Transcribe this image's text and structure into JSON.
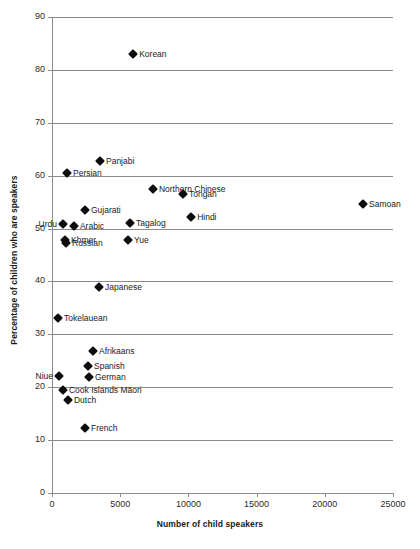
{
  "chart_data": {
    "type": "scatter",
    "title": "",
    "xlabel": "Number of child speakers",
    "ylabel": "Percentage of children who are speakers",
    "xlim": [
      0,
      25000
    ],
    "ylim": [
      0,
      90
    ],
    "xticks": [
      0,
      5000,
      10000,
      15000,
      20000,
      25000
    ],
    "yticks": [
      0,
      10,
      20,
      30,
      40,
      50,
      60,
      70,
      80,
      90
    ],
    "xtick_labels": [
      "0",
      "5000",
      "10000",
      "15000",
      "20000",
      "25000"
    ],
    "ytick_labels": [
      "0",
      "10",
      "20",
      "30",
      "40",
      "50",
      "60",
      "70",
      "80",
      "90"
    ],
    "grid": "horizontal",
    "legend": "none",
    "marker": "diamond",
    "marker_color": "#0d0d0d",
    "grid_color": "#8c8c8c",
    "points": [
      {
        "label": "Korean",
        "x": 5950,
        "y": 83.0,
        "label_side": "right"
      },
      {
        "label": "Panjabi",
        "x": 3520,
        "y": 62.8,
        "label_side": "right"
      },
      {
        "label": "Persian",
        "x": 1100,
        "y": 60.5,
        "label_side": "right"
      },
      {
        "label": "Northern Chinese",
        "x": 7400,
        "y": 57.4,
        "label_side": "right"
      },
      {
        "label": "Tongan",
        "x": 9600,
        "y": 56.6,
        "label_side": "right"
      },
      {
        "label": "Samoan",
        "x": 22800,
        "y": 54.6,
        "label_side": "right"
      },
      {
        "label": "Gujarati",
        "x": 2420,
        "y": 53.6,
        "label_side": "right"
      },
      {
        "label": "Hindi",
        "x": 10200,
        "y": 52.2,
        "label_side": "right"
      },
      {
        "label": "Urdu",
        "x": 810,
        "y": 50.9,
        "label_side": "left"
      },
      {
        "label": "Tagalog",
        "x": 5720,
        "y": 51.0,
        "label_side": "right"
      },
      {
        "label": "Arabic",
        "x": 1610,
        "y": 50.4,
        "label_side": "right"
      },
      {
        "label": "Yue",
        "x": 5570,
        "y": 47.9,
        "label_side": "right"
      },
      {
        "label": "Khmer",
        "x": 953,
        "y": 47.8,
        "label_side": "right"
      },
      {
        "label": "Russian",
        "x": 1027,
        "y": 47.2,
        "label_side": "right"
      },
      {
        "label": "Japanese",
        "x": 3450,
        "y": 39.0,
        "label_side": "right"
      },
      {
        "label": "Tokelauean",
        "x": 440,
        "y": 33.0,
        "label_side": "right"
      },
      {
        "label": "Afrikaans",
        "x": 3010,
        "y": 26.8,
        "label_side": "right"
      },
      {
        "label": "Spanish",
        "x": 2640,
        "y": 24.0,
        "label_side": "right"
      },
      {
        "label": "Niue",
        "x": 513,
        "y": 22.2,
        "label_side": "left"
      },
      {
        "label": "German",
        "x": 2710,
        "y": 22.0,
        "label_side": "right"
      },
      {
        "label": "Cook Islands Māori",
        "x": 806,
        "y": 19.5,
        "label_side": "right"
      },
      {
        "label": "Dutch",
        "x": 1173,
        "y": 17.6,
        "label_side": "right"
      },
      {
        "label": "French",
        "x": 2420,
        "y": 12.3,
        "label_side": "right"
      }
    ]
  }
}
